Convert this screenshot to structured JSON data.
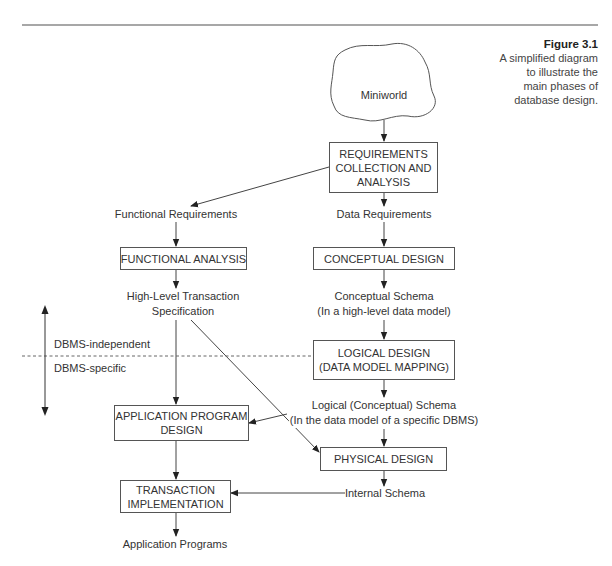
{
  "figure": {
    "number": "Figure 3.1",
    "caption_lines": [
      "A simplified diagram",
      "to illustrate the",
      "main phases of",
      "database design."
    ]
  },
  "nodes": {
    "miniworld": {
      "label": "Miniworld",
      "shape": "cloud"
    },
    "requirements": {
      "lines": [
        "REQUIREMENTS",
        "COLLECTION AND",
        "ANALYSIS"
      ]
    },
    "functional_requirements": {
      "label": "Functional Requirements"
    },
    "data_requirements": {
      "label": "Data Requirements"
    },
    "functional_analysis": {
      "lines": [
        "FUNCTIONAL ANALYSIS"
      ]
    },
    "conceptual_design": {
      "lines": [
        "CONCEPTUAL DESIGN"
      ]
    },
    "high_level_spec": {
      "lines": [
        "High-Level Transaction",
        "Specification"
      ]
    },
    "conceptual_schema": {
      "lines": [
        "Conceptual Schema",
        "(In a high-level data model)"
      ]
    },
    "logical_design": {
      "lines": [
        "LOGICAL DESIGN",
        "(DATA MODEL MAPPING)"
      ]
    },
    "logical_schema": {
      "lines": [
        "Logical (Conceptual) Schema",
        "(In the data model of a specific DBMS)"
      ]
    },
    "app_program_design": {
      "lines": [
        "APPLICATION PROGRAM",
        "DESIGN"
      ]
    },
    "physical_design": {
      "lines": [
        "PHYSICAL DESIGN"
      ]
    },
    "internal_schema": {
      "label": "Internal Schema"
    },
    "transaction_implementation": {
      "lines": [
        "TRANSACTION",
        "IMPLEMENTATION"
      ]
    },
    "application_programs": {
      "label": "Application Programs"
    }
  },
  "divider": {
    "upper_label": "DBMS-independent",
    "lower_label": "DBMS-specific",
    "style": "dashed"
  },
  "edges": [
    {
      "from": "miniworld",
      "to": "requirements"
    },
    {
      "from": "requirements",
      "to": "functional_requirements"
    },
    {
      "from": "requirements",
      "to": "data_requirements"
    },
    {
      "from": "functional_requirements",
      "to": "functional_analysis"
    },
    {
      "from": "functional_analysis",
      "to": "high_level_spec"
    },
    {
      "from": "high_level_spec",
      "to": "app_program_design"
    },
    {
      "from": "high_level_spec",
      "to": "physical_design"
    },
    {
      "from": "data_requirements",
      "to": "conceptual_design"
    },
    {
      "from": "conceptual_design",
      "to": "conceptual_schema"
    },
    {
      "from": "conceptual_schema",
      "to": "logical_design"
    },
    {
      "from": "logical_design",
      "to": "logical_schema"
    },
    {
      "from": "logical_schema",
      "to": "app_program_design"
    },
    {
      "from": "logical_schema",
      "to": "physical_design"
    },
    {
      "from": "physical_design",
      "to": "internal_schema"
    },
    {
      "from": "internal_schema",
      "to": "transaction_implementation"
    },
    {
      "from": "app_program_design",
      "to": "transaction_implementation"
    },
    {
      "from": "transaction_implementation",
      "to": "application_programs"
    }
  ],
  "colors": {
    "line": "#444444",
    "rule": "#888888",
    "text": "#333333",
    "background": "#ffffff"
  }
}
